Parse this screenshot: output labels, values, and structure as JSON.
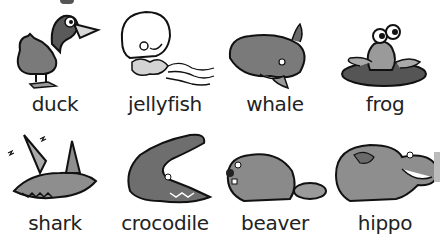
{
  "rows": [
    {
      "animals": [
        {
          "name": "duck",
          "icon": "duck-icon"
        },
        {
          "name": "jellyfish",
          "icon": "jellyfish-icon"
        },
        {
          "name": "whale",
          "icon": "whale-icon"
        },
        {
          "name": "frog",
          "icon": "frog-icon"
        }
      ]
    },
    {
      "animals": [
        {
          "name": "shark",
          "icon": "shark-icon"
        },
        {
          "name": "crocodile",
          "icon": "crocodile-icon"
        },
        {
          "name": "beaver",
          "icon": "beaver-icon"
        },
        {
          "name": "hippo",
          "icon": "hippo-icon"
        }
      ]
    }
  ],
  "colors": {
    "ink": "#222222",
    "fill_dark": "#6e6e6e",
    "fill_mid": "#9a9a9a",
    "fill_light": "#d0d0d0"
  }
}
